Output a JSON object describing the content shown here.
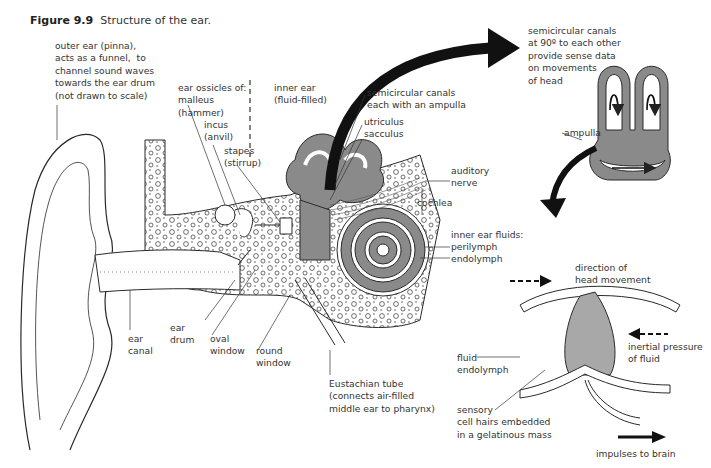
{
  "figure": {
    "number": "Figure 9.9",
    "caption": "Structure of the ear."
  },
  "labels": {
    "outer_ear": "outer ear (pinna),\nacts as a funnel,  to\nchannel sound waves\ntowards the ear drum\n(not drawn to scale)",
    "ossicles": "ear ossicles of:\nmalleus\n(hammer)",
    "incus": "incus\n(anvil)",
    "stapes": "stapes\n(stirrup)",
    "inner_ear": "inner ear\n(fluid-filled)",
    "semicircular": "semicircular canals\neach with an ampulla",
    "utriculus": "utriculus",
    "sacculus": "sacculus",
    "auditory_nerve": "auditory\nnerve",
    "cochlea": "cochlea",
    "inner_fluids": "inner ear fluids:",
    "perilymph": "perilymph",
    "endolymph": "endolymph",
    "ear_canal": "ear\ncanal",
    "ear_drum": "ear\ndrum",
    "oval_window": "oval\nwindow",
    "round_window": "round\nwindow",
    "eustachian": "Eustachian tube\n(connects air-filled\nmiddle ear to pharynx)",
    "canals_90": "semicircular canals\nat 90º to each other\nprovide sense data\non movements\nof head",
    "ampulla": "ampulla",
    "head_movement": "direction of\nhead movement",
    "inertial": "inertial pressure\nof fluid",
    "fluid_endolymph": "fluid\nendolymph",
    "sensory": "sensory\ncell hairs embedded\nin a gelatinous mass",
    "impulses": "impulses to brain"
  },
  "colors": {
    "fluid_gray": "#8a8a8a",
    "line": "#2a2a2a",
    "arrow": "#111111"
  }
}
